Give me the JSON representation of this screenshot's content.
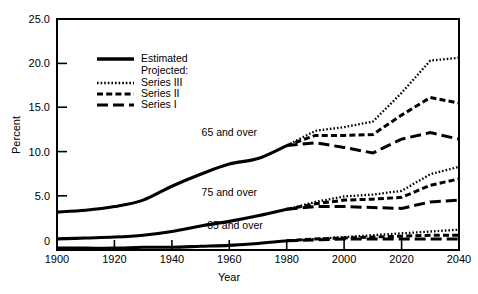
{
  "chart_data": {
    "type": "line",
    "title": "",
    "xlabel": "Year",
    "ylabel": "Percent",
    "xlim": [
      1900,
      2040
    ],
    "ylim": [
      0,
      25
    ],
    "grid": false,
    "xticks": [
      1900,
      1920,
      1940,
      1960,
      1980,
      2000,
      2020,
      2040
    ],
    "xtick_labels": [
      "1900",
      "1920",
      "1940",
      "1960",
      "1980",
      "2000",
      "2020",
      "2040"
    ],
    "yticks": [
      0,
      5,
      10,
      15,
      20,
      25
    ],
    "ytick_labels": [
      "0",
      "5.0",
      "10.0",
      "15.0",
      "20.0",
      "25.0"
    ],
    "legend_position": "upper-left-inside",
    "legend_entries": [
      {
        "key": "estimated",
        "label": "Estimated",
        "style": "solid"
      },
      {
        "key": "projected_header",
        "label": "Projected:",
        "style": "none"
      },
      {
        "key": "series3",
        "label": "Series III",
        "style": "dotted"
      },
      {
        "key": "series2",
        "label": "Series II",
        "style": "dashed-short"
      },
      {
        "key": "series1",
        "label": "Series I",
        "style": "dashed-long"
      }
    ],
    "annotations": [
      {
        "text": "65 and over",
        "x": 1960,
        "y": 12.3
      },
      {
        "text": "75 and over",
        "x": 1960,
        "y": 5.9
      },
      {
        "text": "85 and over",
        "x": 1962,
        "y": 2.3
      }
    ],
    "groups": [
      {
        "name": "65 and over",
        "estimated": {
          "x": [
            1900,
            1910,
            1920,
            1930,
            1940,
            1950,
            1960,
            1970,
            1980
          ],
          "y": [
            4.1,
            4.3,
            4.7,
            5.4,
            6.9,
            8.2,
            9.3,
            9.9,
            11.3
          ]
        },
        "projected": {
          "series3": {
            "x": [
              1980,
              1990,
              2000,
              2010,
              2020,
              2030,
              2040
            ],
            "y": [
              11.3,
              12.9,
              13.3,
              13.9,
              17.0,
              20.5,
              20.8
            ]
          },
          "series2": {
            "x": [
              1980,
              1990,
              2000,
              2010,
              2020,
              2030,
              2040
            ],
            "y": [
              11.3,
              12.4,
              12.4,
              12.5,
              14.6,
              16.5,
              15.9
            ]
          },
          "series1": {
            "x": [
              1980,
              1990,
              2000,
              2010,
              2020,
              2030,
              2040
            ],
            "y": [
              11.3,
              11.6,
              11.1,
              10.5,
              12.0,
              12.7,
              12.0
            ]
          }
        }
      },
      {
        "name": "75 and over",
        "estimated": {
          "x": [
            1900,
            1910,
            1920,
            1930,
            1940,
            1950,
            1960,
            1970,
            1980
          ],
          "y": [
            1.2,
            1.3,
            1.4,
            1.6,
            2.0,
            2.6,
            3.1,
            3.7,
            4.4
          ]
        },
        "projected": {
          "series3": {
            "x": [
              1980,
              1990,
              2000,
              2010,
              2020,
              2030,
              2040
            ],
            "y": [
              4.4,
              5.2,
              5.8,
              6.0,
              6.4,
              8.2,
              9.0
            ]
          },
          "series2": {
            "x": [
              1980,
              1990,
              2000,
              2010,
              2020,
              2030,
              2040
            ],
            "y": [
              4.4,
              5.0,
              5.4,
              5.5,
              5.7,
              7.0,
              7.7
            ]
          },
          "series1": {
            "x": [
              1980,
              1990,
              2000,
              2010,
              2020,
              2030,
              2040
            ],
            "y": [
              4.4,
              4.7,
              4.7,
              4.6,
              4.5,
              5.2,
              5.4
            ]
          }
        }
      },
      {
        "name": "85 and over",
        "estimated": {
          "x": [
            1900,
            1910,
            1920,
            1930,
            1940,
            1950,
            1960,
            1970,
            1980
          ],
          "y": [
            0.2,
            0.2,
            0.2,
            0.3,
            0.3,
            0.4,
            0.5,
            0.7,
            1.0
          ]
        },
        "projected": {
          "series3": {
            "x": [
              1980,
              1990,
              2000,
              2010,
              2020,
              2030,
              2040
            ],
            "y": [
              1.0,
              1.2,
              1.4,
              1.6,
              1.8,
              2.0,
              2.2
            ]
          },
          "series2": {
            "x": [
              1980,
              1990,
              2000,
              2010,
              2020,
              2030,
              2040
            ],
            "y": [
              1.0,
              1.2,
              1.3,
              1.4,
              1.5,
              1.6,
              1.6
            ]
          },
          "series1": {
            "x": [
              1980,
              1990,
              2000,
              2010,
              2020,
              2030,
              2040
            ],
            "y": [
              1.0,
              1.1,
              1.2,
              1.2,
              1.2,
              1.2,
              1.2
            ]
          }
        }
      }
    ]
  }
}
